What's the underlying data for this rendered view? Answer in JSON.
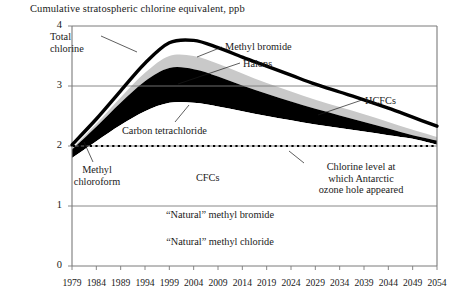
{
  "figure": {
    "axis_title": "Cumulative stratospheric chlorine equivalent, ppb",
    "background_color": "#ffffff",
    "frame_color": "#7a7a7a",
    "band_dark_color": "#000000",
    "band_light_color": "#c9c9c9",
    "band_white_color": "#ffffff",
    "total_line_color": "#000000",
    "threshold_line_color": "#000000"
  },
  "annotations": {
    "total_chlorine": {
      "line1": "Total",
      "line2": "chlorine"
    },
    "methyl_bromide": "Methyl  bromide",
    "halons": "Halons",
    "hcfcs": "HCFCs",
    "carbon_tetrachloride": "Carbon tetrachloride",
    "methyl_chloroform": {
      "line1": "Methyl",
      "line2": "chloroform"
    },
    "cfcs": "CFCs",
    "threshold": {
      "line1": "Chlorine level at",
      "line2": "which Antarctic",
      "line3": "ozone hole appeared"
    },
    "natural_methyl_bromide": "“Natural” methyl bromide",
    "natural_methyl_chloride": "“Natural” methyl chloride"
  },
  "chart_data": {
    "type": "area",
    "title": "Cumulative stratospheric chlorine equivalent, ppb",
    "xlabel": "",
    "ylabel": "Cumulative stratospheric chlorine equivalent, ppb",
    "xlim": [
      1979,
      2054
    ],
    "ylim": [
      0,
      4
    ],
    "yticks": [
      0,
      1,
      2,
      3,
      4
    ],
    "xticks": [
      1979,
      1984,
      1989,
      1994,
      1999,
      2004,
      2009,
      2014,
      2019,
      2024,
      2029,
      2034,
      2039,
      2044,
      2049,
      2054
    ],
    "grid": "horizontal",
    "legend_position": "inline-annotations",
    "x": [
      1979,
      1984,
      1989,
      1994,
      1999,
      2004,
      2009,
      2014,
      2019,
      2024,
      2029,
      2034,
      2039,
      2044,
      2049,
      2054
    ],
    "annotations": [
      {
        "text": "Total chlorine",
        "x": 1990,
        "y": 3.45
      },
      {
        "text": "Methyl  bromide",
        "x": 2020,
        "y": 3.7
      },
      {
        "text": "Halons",
        "x": 2022,
        "y": 3.4
      },
      {
        "text": "HCFCs",
        "x": 2042,
        "y": 2.95
      },
      {
        "text": "Carbon tetrachloride",
        "x": 2006,
        "y": 2.45
      },
      {
        "text": "Methyl chloroform",
        "x": 1991,
        "y": 1.72
      },
      {
        "text": "CFCs",
        "x": 2011,
        "y": 1.7
      },
      {
        "text": "Chlorine level at which Antarctic ozone hole appeared",
        "x": 2036,
        "y": 1.72
      },
      {
        "text": "“Natural” methyl bromide",
        "x": 2008,
        "y": 0.82
      },
      {
        "text": "“Natural” methyl chloride",
        "x": 2008,
        "y": 0.45
      }
    ],
    "threshold_line": {
      "label": "Chlorine level at which Antarctic ozone hole appeared",
      "value": 2.0,
      "style": "dotted"
    },
    "series": [
      {
        "name": "Total chlorine",
        "style": "thick-line",
        "values": [
          2.02,
          2.45,
          2.92,
          3.38,
          3.72,
          3.76,
          3.64,
          3.48,
          3.33,
          3.18,
          3.03,
          2.9,
          2.77,
          2.63,
          2.48,
          2.33
        ]
      },
      {
        "name": "Methyl bromide",
        "style": "band-white",
        "values": [
          1.98,
          2.41,
          2.87,
          3.31,
          3.64,
          3.66,
          3.53,
          3.36,
          3.2,
          3.05,
          2.9,
          2.77,
          2.64,
          2.5,
          2.36,
          2.22
        ]
      },
      {
        "name": "Halons",
        "style": "band-white",
        "values": [
          1.96,
          2.37,
          2.81,
          3.22,
          3.5,
          3.5,
          3.37,
          3.21,
          3.05,
          2.91,
          2.77,
          2.65,
          2.53,
          2.4,
          2.27,
          2.15
        ]
      },
      {
        "name": "HCFCs",
        "style": "band-light",
        "values": [
          1.94,
          2.32,
          2.72,
          3.08,
          3.3,
          3.28,
          3.16,
          3.01,
          2.87,
          2.74,
          2.62,
          2.51,
          2.4,
          2.29,
          2.18,
          2.09
        ]
      },
      {
        "name": "Carbon tetrachloride",
        "style": "band-dark",
        "values": [
          1.9,
          2.22,
          2.55,
          2.82,
          2.97,
          2.95,
          2.85,
          2.73,
          2.62,
          2.52,
          2.42,
          2.33,
          2.25,
          2.17,
          2.1,
          2.04
        ]
      },
      {
        "name": "Methyl chloroform",
        "style": "band-dark",
        "values": [
          1.8,
          2.08,
          2.35,
          2.58,
          2.72,
          2.72,
          2.66,
          2.58,
          2.5,
          2.43,
          2.36,
          2.3,
          2.24,
          2.18,
          2.12,
          2.02
        ]
      },
      {
        "name": "CFCs",
        "style": "band-white",
        "values": [
          1.66,
          1.9,
          2.13,
          2.34,
          2.47,
          2.49,
          2.45,
          2.4,
          2.35,
          2.3,
          2.26,
          2.22,
          2.18,
          2.13,
          2.08,
          1.99
        ]
      },
      {
        "name": "“Natural” methyl bromide",
        "style": "baseline-region",
        "values": [
          1.0,
          1.0,
          1.0,
          1.0,
          1.0,
          1.0,
          1.0,
          1.0,
          1.0,
          1.0,
          1.0,
          1.0,
          1.0,
          1.0,
          1.0,
          1.0
        ]
      },
      {
        "name": "“Natural” methyl chloride",
        "style": "baseline-region",
        "values": [
          0.0,
          0.0,
          0.0,
          0.0,
          0.0,
          0.0,
          0.0,
          0.0,
          0.0,
          0.0,
          0.0,
          0.0,
          0.0,
          0.0,
          0.0,
          0.0
        ]
      }
    ]
  },
  "axes": {
    "ytick_labels": [
      "4",
      "3",
      "2",
      "1",
      "0"
    ],
    "xtick_labels": [
      "1979",
      "1984",
      "1989",
      "1994",
      "1999",
      "2004",
      "2009",
      "2014",
      "2019",
      "2024",
      "2029",
      "2034",
      "2039",
      "2044",
      "2049",
      "2054"
    ]
  }
}
